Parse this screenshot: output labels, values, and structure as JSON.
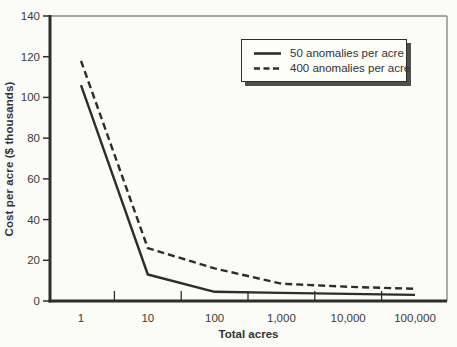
{
  "chart_data": {
    "type": "line",
    "title": "",
    "xlabel": "Total acres",
    "ylabel": "Cost per acre ($ thousands)",
    "x_scale": "log",
    "x_values": [
      1,
      10,
      100,
      1000,
      10000,
      100000
    ],
    "x_tick_labels": [
      "1",
      "10",
      "100",
      "1,000",
      "10,000",
      "100,000"
    ],
    "y_tick_values": [
      0,
      20,
      40,
      60,
      80,
      100,
      120,
      140
    ],
    "y_tick_labels": [
      "0",
      "20",
      "40",
      "60",
      "80",
      "100",
      "120",
      "140"
    ],
    "ylim": [
      0,
      140
    ],
    "grid": false,
    "legend_position": "top-right",
    "series": [
      {
        "name": "50 anomalies per acre",
        "line_style": "solid",
        "values": [
          106,
          13,
          4.5,
          4,
          3.5,
          3
        ]
      },
      {
        "name": "400 anomalies per acre",
        "line_style": "dashed",
        "values": [
          118,
          26,
          16,
          8.5,
          7,
          6
        ]
      }
    ],
    "colors": {
      "line": "#2d2d2d",
      "frame": "#8a8a8a",
      "text": "#3a3a3a",
      "legend_shadow": "#4f4f4f",
      "background": "#fbfbf8"
    }
  }
}
